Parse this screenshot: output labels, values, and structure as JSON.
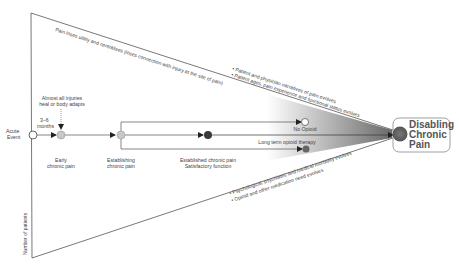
{
  "diagram": {
    "top_edge_label": "Pain loses utility and centralizes (loses connection with injury at the site of pain)",
    "upper_bullets": [
      "• Patient and physician narratives of pain evolves",
      "• Patient ages, pain experience and functional status evolves"
    ],
    "lower_bullets": [
      "• Psychological, psychiatric and medical morbidity evolves",
      "• Opioid and other medication need evolves"
    ],
    "y_axis_label": "Number of patients",
    "nodes": {
      "acute_event": [
        "Acute",
        "Event"
      ],
      "duration": [
        "3–6",
        "months"
      ],
      "injury_note": [
        "Almost all injuries",
        "heal or body adapts"
      ],
      "early": [
        "Early",
        "chronic pain"
      ],
      "establishing": [
        "Establishing",
        "chronic pain"
      ],
      "established": [
        "Established chronic pain",
        "Satisfactory function"
      ],
      "no_opioid": "No Opioid",
      "long_term_opioid": "Long term opioid therapy",
      "disabling": [
        "Disabling",
        "Chronic",
        "Pain"
      ]
    },
    "colors": {
      "line": "#555555",
      "light_node": "#c8c8c8",
      "dark_node": "#3a3a3a",
      "mid_node": "#6a6a6a",
      "gradient_end": "#707070"
    }
  }
}
